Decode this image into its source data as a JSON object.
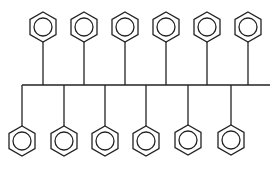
{
  "diagram": {
    "stroke_color": "#222222",
    "background": "#ffffff",
    "backbone": {
      "x1": 22,
      "x2": 270,
      "y": 85
    },
    "top_rings": [
      {
        "cx": 43,
        "cy": 27
      },
      {
        "cx": 84,
        "cy": 27
      },
      {
        "cx": 125,
        "cy": 27
      },
      {
        "cx": 166,
        "cy": 27
      },
      {
        "cx": 207,
        "cy": 27
      },
      {
        "cx": 248,
        "cy": 27
      }
    ],
    "bottom_rings": [
      {
        "cx": 22,
        "cy": 141
      },
      {
        "cx": 64,
        "cy": 141
      },
      {
        "cx": 105,
        "cy": 141
      },
      {
        "cx": 146,
        "cy": 141
      },
      {
        "cx": 188,
        "cy": 140
      },
      {
        "cx": 231,
        "cy": 140
      }
    ],
    "ring_radius": 15,
    "inner_circle_radius": 9
  }
}
